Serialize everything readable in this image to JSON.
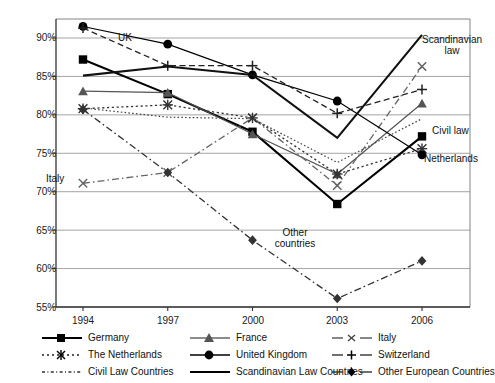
{
  "chart_data": {
    "type": "line",
    "title": "",
    "xlabel": "",
    "ylabel": "",
    "x": [
      "1994",
      "1997",
      "2000",
      "2003",
      "2006"
    ],
    "categories": [
      "1994",
      "1997",
      "2000",
      "2003",
      "2006"
    ],
    "ylim": [
      55,
      92.5
    ],
    "ytick_labels": [
      "55%",
      "60%",
      "65%",
      "70%",
      "75%",
      "80%",
      "85%",
      "90%"
    ],
    "ytick_values": [
      55,
      60,
      65,
      70,
      75,
      80,
      85,
      90
    ],
    "grid": "horizontal",
    "legend_position": "below-axis",
    "series": [
      {
        "name": "Germany",
        "marker": "filled-square",
        "line": "solid-thick",
        "color": "#000000",
        "values": [
          87.2,
          82.7,
          77.8,
          68.4,
          77.2
        ]
      },
      {
        "name": "France",
        "marker": "filled-triangle",
        "line": "solid-thin",
        "color": "#555555",
        "values": [
          83.1,
          82.9,
          77.5,
          72.3,
          81.5
        ]
      },
      {
        "name": "Italy",
        "marker": "cross-x",
        "line": "dash-dot",
        "color": "#666666",
        "values": [
          71.1,
          72.5,
          79.6,
          70.8,
          86.3
        ]
      },
      {
        "name": "The Netherlands",
        "marker": "asterisk",
        "line": "dotted-dash",
        "color": "#333333",
        "values": [
          80.8,
          81.3,
          79.6,
          72.3,
          75.6
        ]
      },
      {
        "name": "United Kingdom",
        "marker": "filled-circle",
        "line": "solid-thin",
        "color": "#000000",
        "values": [
          91.5,
          89.2,
          85.2,
          81.8,
          74.8
        ]
      },
      {
        "name": "Switzerland",
        "marker": "plus",
        "line": "dashed",
        "color": "#222222",
        "values": [
          91.3,
          86.4,
          86.4,
          80.2,
          83.3
        ]
      },
      {
        "name": "Civil Law Countries",
        "marker": "none",
        "line": "fine-dotted",
        "color": "#444444",
        "values": [
          80.9,
          79.7,
          79.5,
          73.8,
          79.5
        ]
      },
      {
        "name": "Scandinavian Law Countries",
        "marker": "none",
        "line": "solid-thick",
        "color": "#111111",
        "values": [
          85.1,
          86.3,
          85.2,
          77.0,
          90.4
        ]
      },
      {
        "name": "Other European Countries",
        "marker": "filled-diamond",
        "line": "dash-dot",
        "color": "#333333",
        "values": [
          80.7,
          72.5,
          63.7,
          56.1,
          61.0
        ]
      }
    ],
    "annotations": [
      {
        "text": "UK",
        "x_pct": 132,
        "y_pct": 37
      },
      {
        "text": "Italy",
        "x_pct": 58,
        "y_pct": 178
      },
      {
        "text": "Scandinavian law",
        "x_pct": 452,
        "y_pct": 40
      },
      {
        "text": "Civil law",
        "x_pct": 457,
        "y_pct": 130
      },
      {
        "text": "Netherlands",
        "x_pct": 455,
        "y_pct": 158
      },
      {
        "text": "Other countries",
        "x_pct": 294,
        "y_pct": 232
      }
    ]
  },
  "legend": {
    "entries": [
      {
        "label": "Germany",
        "symbol": "germany-symbol"
      },
      {
        "label": "France",
        "symbol": "france-symbol"
      },
      {
        "label": "Italy",
        "symbol": "italy-symbol"
      },
      {
        "label": "The Netherlands",
        "symbol": "netherlands-symbol"
      },
      {
        "label": "United Kingdom",
        "symbol": "united-kingdom-symbol"
      },
      {
        "label": "Switzerland",
        "symbol": "switzerland-symbol"
      },
      {
        "label": "Civil Law Countries",
        "symbol": "civil-law-symbol"
      },
      {
        "label": "Scandinavian Law Countries",
        "symbol": "scandinavian-law-symbol"
      },
      {
        "label": "Other European Countries",
        "symbol": "other-european-symbol"
      }
    ]
  }
}
